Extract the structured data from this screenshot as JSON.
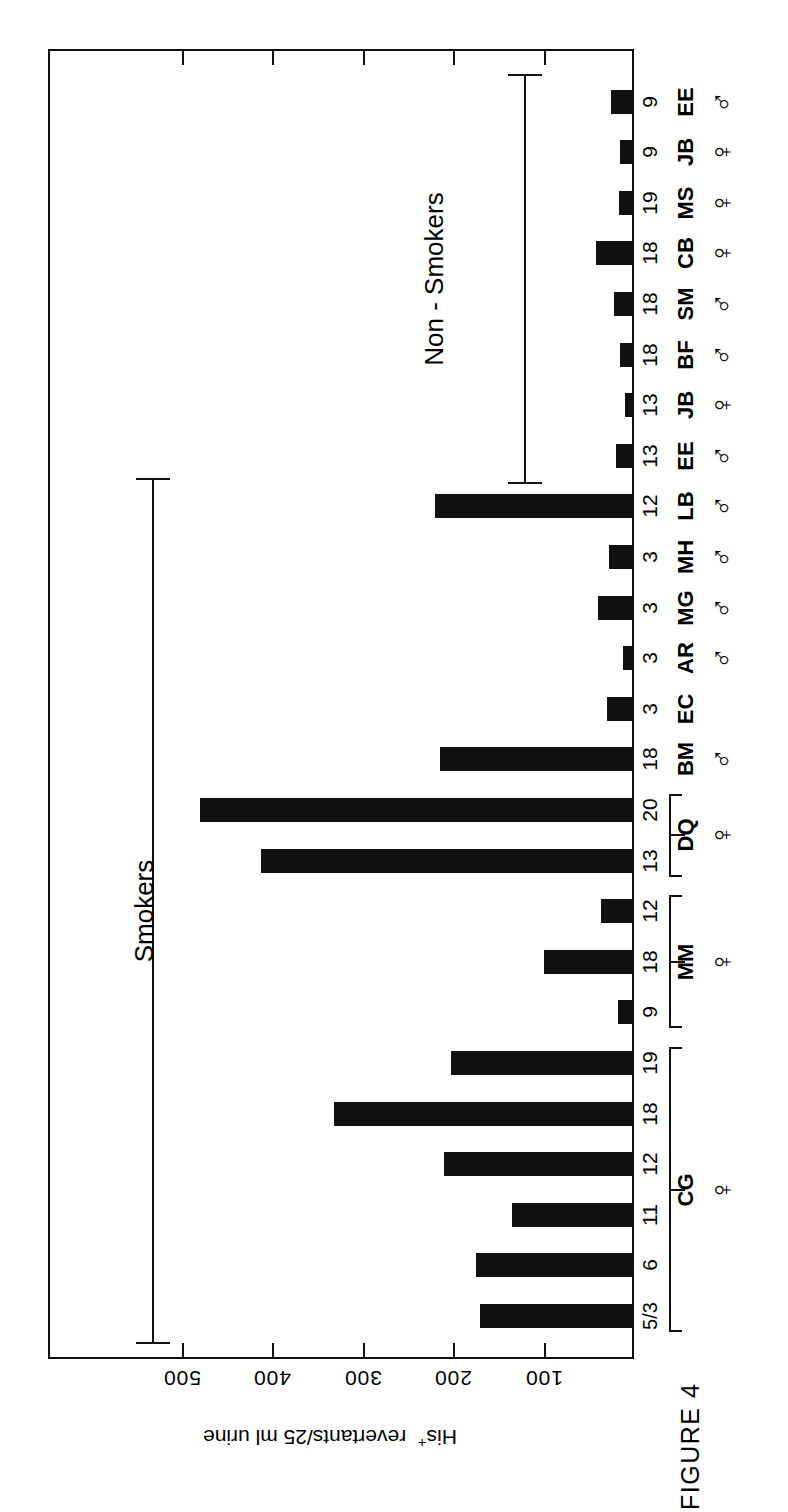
{
  "figure": {
    "caption": "FIGURE 4",
    "axis_title_prefix": "His",
    "axis_title_sup": "+",
    "axis_title_rest": "revertants/25 ml urine"
  },
  "axis": {
    "tick_labels": [
      "500",
      "400",
      "300",
      "200",
      "100"
    ],
    "tick_values": [
      500,
      400,
      300,
      200,
      100
    ],
    "max": 586
  },
  "groups": [
    {
      "label": "Smokers",
      "id": "smokers"
    },
    {
      "label": "Non - Smokers",
      "id": "non-smokers"
    }
  ],
  "chart_data": {
    "type": "bar",
    "title": "FIGURE 4",
    "orientation": "horizontal",
    "xlabel": "His+ revertants/25 ml urine",
    "ylabel": "",
    "xlim": [
      0,
      560
    ],
    "grid": false,
    "legend": null,
    "axis_ticks": [
      100,
      200,
      300,
      400,
      500
    ],
    "group_brackets": [
      "Smokers",
      "Non - Smokers"
    ],
    "categories": [
      "CG 5/3",
      "CG 6",
      "CG 11",
      "CG 12",
      "CG 18",
      "CG 19",
      "MM 9",
      "MM 18",
      "MM 12",
      "DQ 13",
      "DQ 20",
      "BM 18",
      "EC 3",
      "AR 3",
      "MG 3",
      "MH 3",
      "LB 12",
      "EE 13",
      "JB 13",
      "BF 18",
      "SM 18",
      "CB 18",
      "MS 19",
      "JB 9",
      "EE 9"
    ],
    "values": [
      170,
      175,
      135,
      210,
      332,
      202,
      18,
      100,
      36,
      412,
      480,
      214,
      30,
      12,
      40,
      28,
      220,
      20,
      10,
      16,
      22,
      42,
      17,
      15,
      25
    ],
    "rows": [
      {
        "sample": "5/3",
        "subject": "CG",
        "sex": "female",
        "group": "Smokers",
        "value": 170,
        "brace_start": true
      },
      {
        "sample": "6",
        "subject": "CG",
        "sex": "female",
        "group": "Smokers",
        "value": 175
      },
      {
        "sample": "11",
        "subject": "CG",
        "sex": "female",
        "group": "Smokers",
        "value": 135
      },
      {
        "sample": "12",
        "subject": "CG",
        "sex": "female",
        "group": "Smokers",
        "value": 210
      },
      {
        "sample": "18",
        "subject": "CG",
        "sex": "female",
        "group": "Smokers",
        "value": 332
      },
      {
        "sample": "19",
        "subject": "CG",
        "sex": "female",
        "group": "Smokers",
        "value": 202,
        "brace_end": true
      },
      {
        "sample": "9",
        "subject": "MM",
        "sex": "female",
        "group": "Smokers",
        "value": 18,
        "brace_start": true
      },
      {
        "sample": "18",
        "subject": "MM",
        "sex": "female",
        "group": "Smokers",
        "value": 100
      },
      {
        "sample": "12",
        "subject": "MM",
        "sex": "female",
        "group": "Smokers",
        "value": 36,
        "brace_end": true
      },
      {
        "sample": "13",
        "subject": "DQ",
        "sex": "female",
        "group": "Smokers",
        "value": 412,
        "brace_start": true
      },
      {
        "sample": "20",
        "subject": "DQ",
        "sex": "female",
        "group": "Smokers",
        "value": 480,
        "brace_end": true
      },
      {
        "sample": "18",
        "subject": "BM",
        "sex": "male",
        "group": "Smokers",
        "value": 214
      },
      {
        "sample": "3",
        "subject": "EC",
        "sex": "",
        "group": "Smokers",
        "value": 30
      },
      {
        "sample": "3",
        "subject": "AR",
        "sex": "male",
        "group": "Smokers",
        "value": 12
      },
      {
        "sample": "3",
        "subject": "MG",
        "sex": "male",
        "group": "Smokers",
        "value": 40
      },
      {
        "sample": "3",
        "subject": "MH",
        "sex": "male",
        "group": "Smokers",
        "value": 28
      },
      {
        "sample": "12",
        "subject": "LB",
        "sex": "male",
        "group": "Smokers",
        "value": 220
      },
      {
        "sample": "13",
        "subject": "EE",
        "sex": "male",
        "group": "Non - Smokers",
        "value": 20
      },
      {
        "sample": "13",
        "subject": "JB",
        "sex": "female",
        "group": "Non - Smokers",
        "value": 10
      },
      {
        "sample": "18",
        "subject": "BF",
        "sex": "male",
        "group": "Non - Smokers",
        "value": 16
      },
      {
        "sample": "18",
        "subject": "SM",
        "sex": "male",
        "group": "Non - Smokers",
        "value": 22
      },
      {
        "sample": "18",
        "subject": "CB",
        "sex": "female",
        "group": "Non - Smokers",
        "value": 42
      },
      {
        "sample": "19",
        "subject": "MS",
        "sex": "female",
        "group": "Non - Smokers",
        "value": 17
      },
      {
        "sample": "9",
        "subject": "JB",
        "sex": "female",
        "group": "Non - Smokers",
        "value": 15
      },
      {
        "sample": "9",
        "subject": "EE",
        "sex": "male",
        "group": "Non - Smokers",
        "value": 25
      }
    ]
  },
  "symbols": {
    "male": "♂",
    "female": "♀"
  },
  "colors": {
    "bar": "#111111",
    "axis": "#111111",
    "background": "#ffffff"
  }
}
